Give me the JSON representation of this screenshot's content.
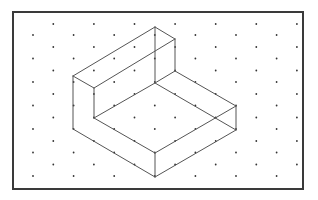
{
  "diagram": {
    "colors": {
      "background": "#ffffff",
      "frame": "#3a3a3a",
      "edge": "#555555",
      "dot": "#333333"
    },
    "frame": {
      "x": 13,
      "y": 12,
      "width": 290,
      "height": 177,
      "stroke_width": 2
    },
    "grid": {
      "x0": 33,
      "dx": 20.3,
      "columns": 14,
      "even_rows_y": [
        35,
        58.5,
        82,
        105.5,
        129,
        152.5,
        176
      ],
      "odd_rows_y": [
        24,
        47,
        70.5,
        94,
        117.5,
        141,
        164.5
      ]
    },
    "vertices": {
      "A": [
        73,
        76
      ],
      "B": [
        155,
        27
      ],
      "C": [
        175,
        39
      ],
      "D": [
        94,
        88
      ],
      "E": [
        73,
        129
      ],
      "F": [
        94,
        118
      ],
      "G": [
        155,
        83
      ],
      "H": [
        175,
        71
      ],
      "I": [
        236,
        106
      ],
      "J": [
        236,
        130
      ],
      "K": [
        155,
        153
      ],
      "L": [
        155,
        177
      ]
    },
    "edges": [
      [
        "A",
        "B"
      ],
      [
        "B",
        "C"
      ],
      [
        "A",
        "D"
      ],
      [
        "D",
        "C"
      ],
      [
        "A",
        "E"
      ],
      [
        "D",
        "F"
      ],
      [
        "B",
        "G"
      ],
      [
        "C",
        "H"
      ],
      [
        "F",
        "G"
      ],
      [
        "G",
        "H"
      ],
      [
        "H",
        "I"
      ],
      [
        "G",
        "J"
      ],
      [
        "F",
        "K"
      ],
      [
        "I",
        "K"
      ],
      [
        "E",
        "L"
      ],
      [
        "K",
        "L"
      ],
      [
        "I",
        "J"
      ],
      [
        "J",
        "L"
      ]
    ]
  }
}
